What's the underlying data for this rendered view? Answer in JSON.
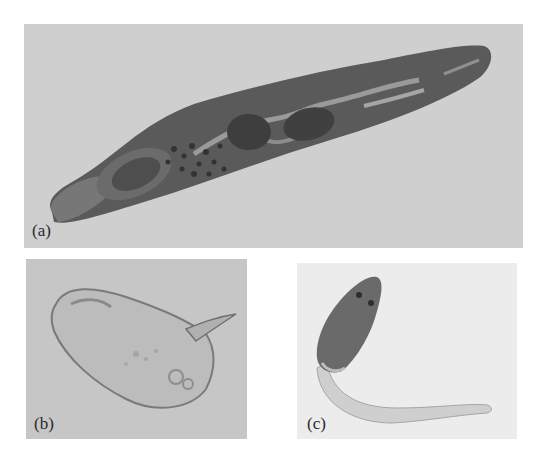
{
  "figure": {
    "panels": [
      {
        "id": "a",
        "label": "(a)",
        "subject": "adult fluke",
        "background": "#cfcfcf",
        "specimen_color": "#555555"
      },
      {
        "id": "b",
        "label": "(b)",
        "subject": "egg with lateral spine",
        "background": "#c6c6c6",
        "specimen_color": "#bdbdbd"
      },
      {
        "id": "c",
        "label": "(c)",
        "subject": "cercaria with tail",
        "background": "#ececec",
        "specimen_color": "#6a6a6a"
      }
    ]
  }
}
